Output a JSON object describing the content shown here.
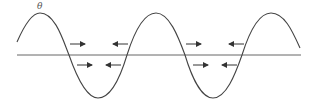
{
  "diagram": {
    "label": "θ",
    "colors": {
      "stroke": "#444444",
      "background": "#ffffff"
    },
    "arrows": [
      {
        "dir": "right",
        "row": "upper"
      },
      {
        "dir": "left",
        "row": "upper"
      },
      {
        "dir": "right",
        "row": "lower"
      },
      {
        "dir": "left",
        "row": "lower"
      },
      {
        "dir": "right",
        "row": "upper"
      },
      {
        "dir": "left",
        "row": "upper"
      },
      {
        "dir": "right",
        "row": "lower"
      },
      {
        "dir": "left",
        "row": "lower"
      }
    ]
  }
}
